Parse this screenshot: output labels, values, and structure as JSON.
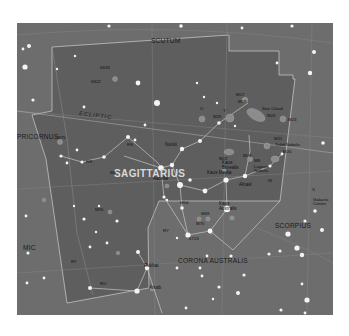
{
  "map": {
    "title": "Sagittarius star chart",
    "background_color": "#6d6d6d",
    "constellation_region_color": "#5f5f5f",
    "line_color": "#c8c8c8",
    "constellations": {
      "main": "SAGITTARIUS",
      "scutum": "SCUTUM",
      "capricornus": "PRICORNUS",
      "microscopium": "MIC",
      "scorpius": "SCORPIUS",
      "corona_australis": "CORONA AUSTRALIS"
    },
    "ecliptic_label": "ECLIPTIC",
    "stars": {
      "nunki": "Nunki",
      "kaus_borealis": "Kaus Borealis",
      "kaus_media": "Kaus Media",
      "kaus_australis": "Kaus Australis",
      "ascella": "Ascella",
      "alnasl": "Alnasl",
      "rukbat": "Rukbat",
      "arkab": "Arkab"
    },
    "deep_sky": {
      "m17": "M17",
      "m18": "M18",
      "m24": "M24",
      "m24_desc": "Star Cloud",
      "m25": "M25",
      "m23": "M23",
      "m20": "M20",
      "m20_desc": "Trifid Nebula",
      "m21": "M21",
      "m8": "M8",
      "m8_desc": "Lagoon Nebula",
      "m22": "M22",
      "m28": "M28",
      "m54": "M54",
      "m55": "M55",
      "m69": "M69",
      "m70": "M70",
      "m75": "M75",
      "ngc6818": "6818",
      "ngc6822": "6822",
      "ngc6723": "6723",
      "galactic_center": "Galactic Center"
    },
    "greek": {
      "u": "U",
      "y": "Y",
      "x": "X",
      "ry": "RY",
      "rr": "RR",
      "rt": "RT",
      "ru": "RU",
      "bb": "BB",
      "w": "W",
      "rs": "RS"
    }
  }
}
